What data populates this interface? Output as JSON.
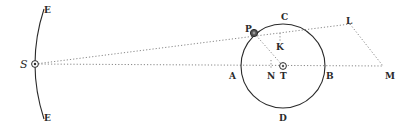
{
  "diagram": {
    "type": "geometric-astronomy-figure",
    "labels": {
      "S": "S",
      "E_top": "E",
      "E_bottom": "E",
      "P": "P",
      "C": "C",
      "K": "K",
      "L": "L",
      "A": "A",
      "N": "N",
      "T": "T",
      "B": "B",
      "M": "M",
      "D": "D"
    },
    "points": {
      "S": [
        35,
        64
      ],
      "P": [
        254,
        33
      ],
      "K": [
        280,
        40
      ],
      "L": [
        350,
        24
      ],
      "T": [
        283,
        66
      ],
      "N": [
        271,
        66
      ],
      "A": [
        240,
        66
      ],
      "B": [
        326,
        66
      ],
      "M": [
        383,
        66
      ],
      "C": [
        283,
        24
      ],
      "D": [
        283,
        108
      ]
    },
    "circle": {
      "center": [
        283,
        66
      ],
      "radius": 42
    },
    "colors": {
      "ink": "#2a2a2a",
      "dotted": "#777777"
    }
  }
}
